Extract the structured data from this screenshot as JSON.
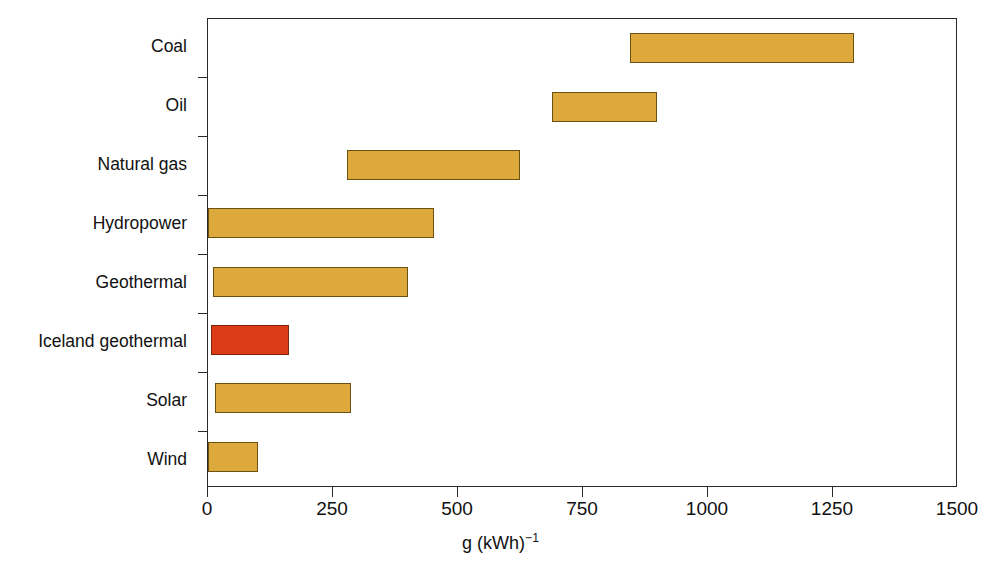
{
  "chart_data": {
    "type": "bar",
    "orientation": "horizontal",
    "bar_style": "range",
    "title": "",
    "subtitle": "",
    "xlabel": "g (kWh)-1",
    "xlabel_base": "g (kWh)",
    "xlabel_exponent": "−1",
    "ylabel": "",
    "xlim": [
      0,
      1500
    ],
    "ylim": null,
    "xticks": [
      0,
      250,
      500,
      750,
      1000,
      1250,
      1500
    ],
    "xtick_labels": [
      "0",
      "250",
      "500",
      "750",
      "1000",
      "1250",
      "1500"
    ],
    "grid": false,
    "legend": null,
    "legend_position": "none",
    "categories": [
      "Coal",
      "Oil",
      "Natural gas",
      "Hydropower",
      "Geothermal",
      "Iceland geothermal",
      "Solar",
      "Wind"
    ],
    "series": [
      {
        "name": "Lifecycle greenhouse gas emissions range",
        "type": "range",
        "values": [
          {
            "category": "Coal",
            "low": 846,
            "high": 1296,
            "color": "#dda83c"
          },
          {
            "category": "Oil",
            "low": 690,
            "high": 900,
            "color": "#dda83c"
          },
          {
            "category": "Natural gas",
            "low": 278,
            "high": 626,
            "color": "#dda83c"
          },
          {
            "category": "Hydropower",
            "low": 0,
            "high": 454,
            "color": "#dda83c"
          },
          {
            "category": "Geothermal",
            "low": 10,
            "high": 402,
            "color": "#dda83c"
          },
          {
            "category": "Iceland geothermal",
            "low": 6,
            "high": 162,
            "color": "#dc3c17"
          },
          {
            "category": "Solar",
            "low": 14,
            "high": 286,
            "color": "#dda83c"
          },
          {
            "category": "Wind",
            "low": 0,
            "high": 100,
            "color": "#dda83c"
          }
        ]
      }
    ],
    "colors": {
      "bar_fill_default": "#dda83c",
      "bar_fill_highlight": "#dc3c17",
      "bar_stroke_default": "#6b5212",
      "bar_stroke_highlight": "#7a2a12",
      "axis": "#2a2a2a",
      "background": "#ffffff",
      "text": "#111111"
    }
  }
}
